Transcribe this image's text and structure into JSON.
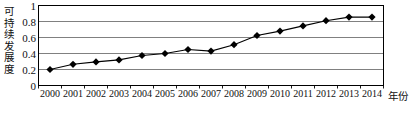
{
  "chart_data": {
    "type": "line",
    "title": "",
    "xlabel": "年份",
    "ylabel": "可持续发展度",
    "ylabel_chars": [
      "可",
      "持",
      "续",
      "发",
      "展",
      "度"
    ],
    "categories": [
      "2000",
      "2001",
      "2002",
      "2003",
      "2004",
      "2005",
      "2006",
      "2007",
      "2008",
      "2009",
      "2010",
      "2011",
      "2012",
      "2013",
      "2014"
    ],
    "x": [
      2000,
      2001,
      2002,
      2003,
      2004,
      2005,
      2006,
      2007,
      2008,
      2009,
      2010,
      2011,
      2012,
      2013,
      2014
    ],
    "values": [
      0.2,
      0.265,
      0.295,
      0.32,
      0.375,
      0.4,
      0.45,
      0.43,
      0.51,
      0.625,
      0.68,
      0.745,
      0.81,
      0.855,
      0.855
    ],
    "ylim": [
      0,
      1
    ],
    "yticks": [
      "0",
      "0.2",
      "0.4",
      "0.6",
      "0.8",
      "1"
    ],
    "ytick_values": [
      0,
      0.2,
      0.4,
      0.6,
      0.8,
      1
    ],
    "grid": "horizontal",
    "legend": "none",
    "marker": "diamond",
    "line_color": "#000000",
    "marker_color": "#000000",
    "grid_color": "#808080",
    "frame_color": "#000000",
    "background": "#ffffff"
  }
}
